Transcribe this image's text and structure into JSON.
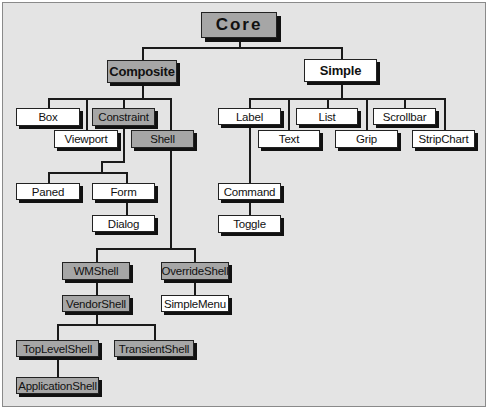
{
  "diagram": {
    "colors": {
      "background": "#e4e4e4",
      "abstract_fill": "#a6a6a6",
      "concrete_fill": "#ffffff",
      "line": "#1a1a1a"
    },
    "nodes": {
      "core": {
        "label": "Core",
        "type": "abstract"
      },
      "composite": {
        "label": "Composite",
        "type": "abstract",
        "parent": "Core"
      },
      "simple": {
        "label": "Simple",
        "type": "concrete",
        "parent": "Core"
      },
      "box": {
        "label": "Box",
        "type": "concrete",
        "parent": "Composite"
      },
      "viewport": {
        "label": "Viewport",
        "type": "concrete",
        "parent": "Composite"
      },
      "constraint": {
        "label": "Constraint",
        "type": "abstract",
        "parent": "Composite"
      },
      "shell": {
        "label": "Shell",
        "type": "abstract",
        "parent": "Composite"
      },
      "paned": {
        "label": "Paned",
        "type": "concrete",
        "parent": "Constraint"
      },
      "form": {
        "label": "Form",
        "type": "concrete",
        "parent": "Constraint"
      },
      "dialog": {
        "label": "Dialog",
        "type": "concrete",
        "parent": "Form"
      },
      "wmshell": {
        "label": "WMShell",
        "type": "abstract",
        "parent": "Shell"
      },
      "overrideshell": {
        "label": "OverrideShell",
        "type": "abstract",
        "parent": "Shell"
      },
      "vendorshell": {
        "label": "VendorShell",
        "type": "abstract",
        "parent": "WMShell"
      },
      "simplemenu": {
        "label": "SimpleMenu",
        "type": "concrete",
        "parent": "OverrideShell"
      },
      "toplevelshell": {
        "label": "TopLevelShell",
        "type": "abstract",
        "parent": "VendorShell"
      },
      "transientshell": {
        "label": "TransientShell",
        "type": "abstract",
        "parent": "VendorShell"
      },
      "applicationshell": {
        "label": "ApplicationShell",
        "type": "abstract",
        "parent": "TopLevelShell"
      },
      "label": {
        "label": "Label",
        "type": "concrete",
        "parent": "Simple"
      },
      "text": {
        "label": "Text",
        "type": "concrete",
        "parent": "Simple"
      },
      "list": {
        "label": "List",
        "type": "concrete",
        "parent": "Simple"
      },
      "grip": {
        "label": "Grip",
        "type": "concrete",
        "parent": "Simple"
      },
      "scrollbar": {
        "label": "Scrollbar",
        "type": "concrete",
        "parent": "Simple"
      },
      "stripchart": {
        "label": "StripChart",
        "type": "concrete",
        "parent": "Simple"
      },
      "command": {
        "label": "Command",
        "type": "concrete",
        "parent": "Label"
      },
      "toggle": {
        "label": "Toggle",
        "type": "concrete",
        "parent": "Command"
      }
    }
  }
}
